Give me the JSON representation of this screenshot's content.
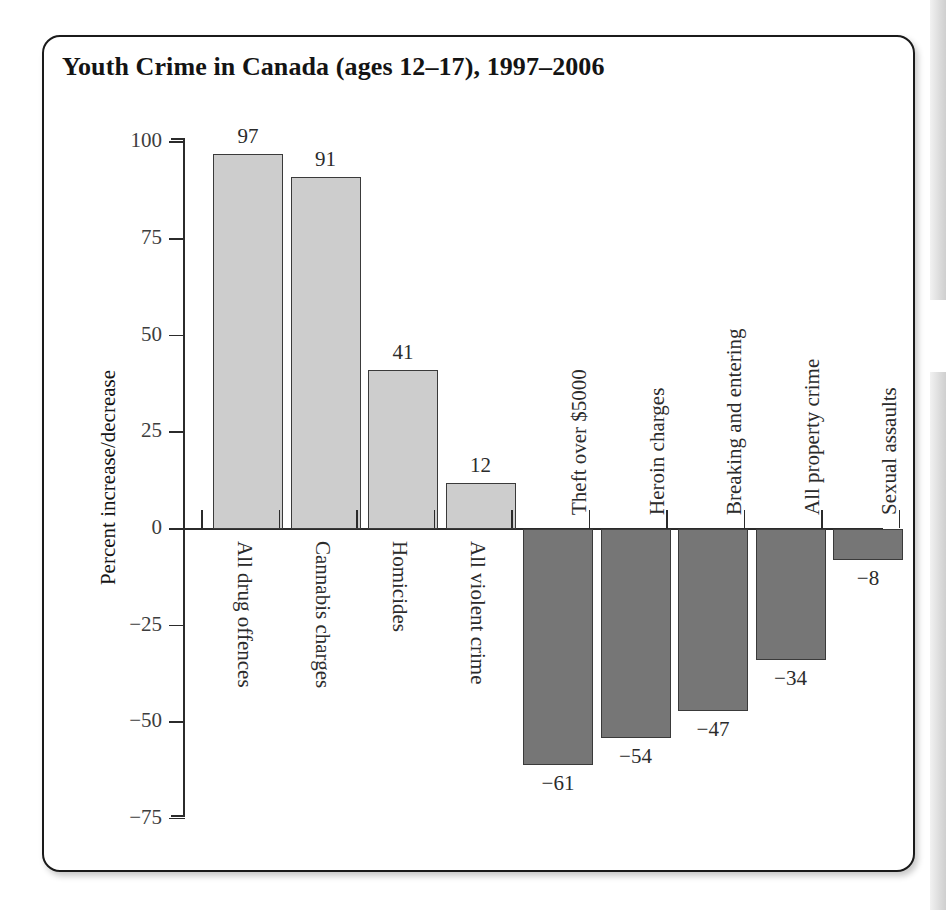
{
  "figure": {
    "title": "Youth Crime in Canada (ages 12–17), 1997–2006"
  },
  "chart_data": {
    "type": "bar",
    "title": "Youth Crime in Canada (ages 12–17), 1997–2006",
    "xlabel": "",
    "ylabel": "Percent increase/decrease",
    "ylim": [
      -75,
      100
    ],
    "yticks": [
      "100",
      "75",
      "50",
      "25",
      "0",
      "−25",
      "−50",
      "−75"
    ],
    "ytick_values": [
      100,
      75,
      50,
      25,
      0,
      -25,
      -50,
      -75
    ],
    "grid": false,
    "legend": "none",
    "categories": [
      "All drug offences",
      "Cannabis charges",
      "Homicides",
      "All violent crime",
      "Theft over $5000",
      "Heroin charges",
      "Breaking and entering",
      "All property crime",
      "Sexual assaults"
    ],
    "values": [
      97,
      91,
      41,
      12,
      -61,
      -54,
      -47,
      -34,
      -8
    ],
    "value_labels": [
      "97",
      "91",
      "41",
      "12",
      "−61",
      "−54",
      "−47",
      "−34",
      "−8"
    ],
    "colors": {
      "positive_fill": "#cdcdcd",
      "negative_fill": "#767676",
      "bar_outline": "#3a3a3a",
      "axis": "#2b2b2b",
      "text": "#141414",
      "frame": "#1a1a1a",
      "background": "#ffffff"
    }
  }
}
